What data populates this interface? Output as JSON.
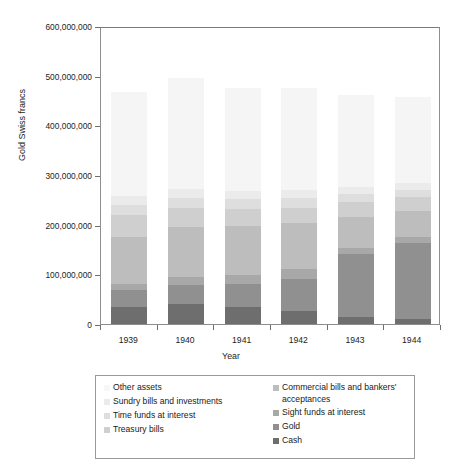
{
  "chart_data": {
    "type": "bar",
    "subtype": "stacked-column",
    "title": "",
    "xlabel": "Year",
    "ylabel": "Gold Swiss francs",
    "categories": [
      "1939",
      "1940",
      "1941",
      "1942",
      "1943",
      "1944"
    ],
    "ylim": [
      0,
      600000000
    ],
    "yticks": [
      0,
      100000000,
      200000000,
      300000000,
      400000000,
      500000000,
      600000000
    ],
    "ytick_labels": [
      "0",
      "100,000,000",
      "200,000,000",
      "300,000,000",
      "400,000,000",
      "500,000,000",
      "600,000,000"
    ],
    "grid": false,
    "legend_position": "bottom",
    "stack_order_bottom_to_top": [
      "Cash",
      "Gold",
      "Sight funds at interest",
      "Commercial bills and bankers' acceptances",
      "Treasury bills",
      "Time funds at interest",
      "Sundry bills and investments",
      "Other assets"
    ],
    "series": [
      {
        "name": "Cash",
        "color": "#6e6e6e",
        "values": [
          34000000,
          40000000,
          34000000,
          26000000,
          14000000,
          10000000
        ]
      },
      {
        "name": "Gold",
        "color": "#909090",
        "values": [
          34000000,
          38000000,
          46000000,
          64000000,
          126000000,
          154000000
        ]
      },
      {
        "name": "Sight funds at interest",
        "color": "#a8a8a8",
        "values": [
          12000000,
          16000000,
          18000000,
          20000000,
          14000000,
          12000000
        ]
      },
      {
        "name": "Commercial bills and bankers' acceptances",
        "color": "#bdbdbd",
        "values": [
          96000000,
          102000000,
          100000000,
          94000000,
          62000000,
          52000000
        ]
      },
      {
        "name": "Treasury bills",
        "color": "#cfcfcf",
        "values": [
          44000000,
          38000000,
          34000000,
          30000000,
          30000000,
          28000000
        ]
      },
      {
        "name": "Time funds at interest",
        "color": "#dedede",
        "values": [
          20000000,
          20000000,
          20000000,
          20000000,
          16000000,
          14000000
        ]
      },
      {
        "name": "Sundry bills and investments",
        "color": "#ebebeb",
        "values": [
          18000000,
          18000000,
          16000000,
          16000000,
          14000000,
          14000000
        ]
      },
      {
        "name": "Other assets",
        "color": "#f5f5f5",
        "values": [
          210000000,
          224000000,
          208000000,
          206000000,
          186000000,
          174000000
        ]
      }
    ],
    "totals": [
      468000000,
      496000000,
      476000000,
      476000000,
      462000000,
      458000000
    ]
  },
  "axes": {
    "y_label": "Gold Swiss francs",
    "x_label": "Year"
  },
  "legend": {
    "left_column": [
      {
        "label": "Other assets",
        "color": "#f5f5f5"
      },
      {
        "label": "Sundry bills and investments",
        "color": "#ebebeb"
      },
      {
        "label": "Time funds at interest",
        "color": "#dedede"
      },
      {
        "label": "Treasury bills",
        "color": "#cfcfcf"
      }
    ],
    "right_column": [
      {
        "label": "Commercial bills and bankers' acceptances",
        "color": "#bdbdbd"
      },
      {
        "label": "Sight funds at interest",
        "color": "#a8a8a8"
      },
      {
        "label": "Gold",
        "color": "#909090"
      },
      {
        "label": "Cash",
        "color": "#6e6e6e"
      }
    ]
  }
}
